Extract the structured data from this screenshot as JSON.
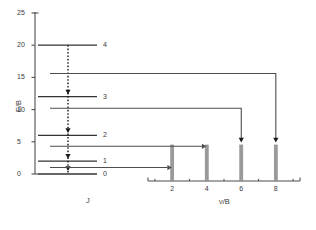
{
  "figure": {
    "y_axis": {
      "label": "E/B",
      "ticks": [
        0,
        5,
        10,
        15,
        20,
        25
      ],
      "tick_labels": [
        "0",
        "5",
        "10",
        "15",
        "20",
        "25"
      ],
      "range": [
        0,
        25
      ]
    },
    "level_axis": {
      "label": "J",
      "level_labels": [
        "0",
        "1",
        "2",
        "3",
        "4"
      ]
    },
    "spectrum_axis": {
      "label": "ν/B",
      "ticks": [
        2,
        4,
        6,
        8
      ],
      "tick_labels": [
        "2",
        "4",
        "6",
        "8"
      ],
      "minor_ticks": [
        1,
        3,
        5,
        7,
        9
      ],
      "range": [
        0.6,
        9.4
      ]
    },
    "colors": {
      "line": "#4d4d4d",
      "level": "#333333",
      "peak": "#9a9a9a",
      "text": "#3a3a3a",
      "background": "#ffffff"
    }
  },
  "chart_data": {
    "type": "line",
    "title": "",
    "subtitle": "",
    "xlabel": "ν/B",
    "ylabel": "E/B",
    "xlim": [
      0.6,
      9.4
    ],
    "ylim": [
      0,
      25
    ],
    "grid": false,
    "legend": "none",
    "energy_levels": [
      {
        "J": 0,
        "label": "0",
        "energy": 0
      },
      {
        "J": 1,
        "label": "1",
        "energy": 2
      },
      {
        "J": 2,
        "label": "2",
        "energy": 6
      },
      {
        "J": 3,
        "label": "3",
        "energy": 12
      },
      {
        "J": 4,
        "label": "4",
        "energy": 20
      }
    ],
    "transitions": [
      {
        "from_J": 0,
        "to_J": 1,
        "delta_E": 2,
        "connector_energy": 1.0,
        "peak_x": 2
      },
      {
        "from_J": 1,
        "to_J": 2,
        "delta_E": 4,
        "connector_energy": 4.3,
        "peak_x": 4
      },
      {
        "from_J": 2,
        "to_J": 3,
        "delta_E": 6,
        "connector_energy": 10.2,
        "peak_x": 6
      },
      {
        "from_J": 3,
        "to_J": 4,
        "delta_E": 8,
        "connector_energy": 15.6,
        "peak_x": 8
      }
    ],
    "spectrum_peaks": [
      {
        "x": 2,
        "height": 5.6
      },
      {
        "x": 4,
        "height": 5.6
      },
      {
        "x": 6,
        "height": 5.6
      },
      {
        "x": 8,
        "height": 5.6
      }
    ],
    "dashed_arrow_marks": [
      0.7,
      2.6,
      6.6,
      12.6
    ]
  }
}
